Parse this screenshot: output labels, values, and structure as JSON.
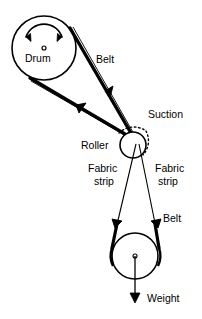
{
  "figure": {
    "background_color": "#ffffff",
    "line_color": "#000000",
    "width": 202,
    "height": 319
  },
  "labels": {
    "drum": "Drum",
    "belt_upper": "Belt",
    "suction": "Suction",
    "roller": "Roller",
    "fabric_strip_left_line1": "Fabric",
    "fabric_strip_left_line2": "strip",
    "fabric_strip_right_line1": "Fabric",
    "fabric_strip_right_line2": "strip",
    "belt_lower": "Belt",
    "weight": "Weight"
  },
  "components": {
    "drum": {
      "name": "drum",
      "shape": "circle",
      "cx": 44,
      "cy": 48,
      "r": 32,
      "center_dot_r": 2,
      "rotation_arrow": "double-headed-curved-arc"
    },
    "roller": {
      "name": "roller",
      "shape": "circle",
      "cx": 133,
      "cy": 145,
      "r": 13
    },
    "pulley": {
      "name": "weight-pulley",
      "shape": "circle",
      "cx": 135,
      "cy": 256,
      "r": 23,
      "center_dot_r": 2
    },
    "suction": {
      "name": "suction-zone",
      "shape": "dotted-arc",
      "cx": 133,
      "cy": 145,
      "r": 22
    },
    "weight_arrow": {
      "name": "weight-force-arrow",
      "from_x": 135,
      "from_y": 256,
      "to_x": 135,
      "to_y": 302,
      "direction": "down"
    }
  }
}
